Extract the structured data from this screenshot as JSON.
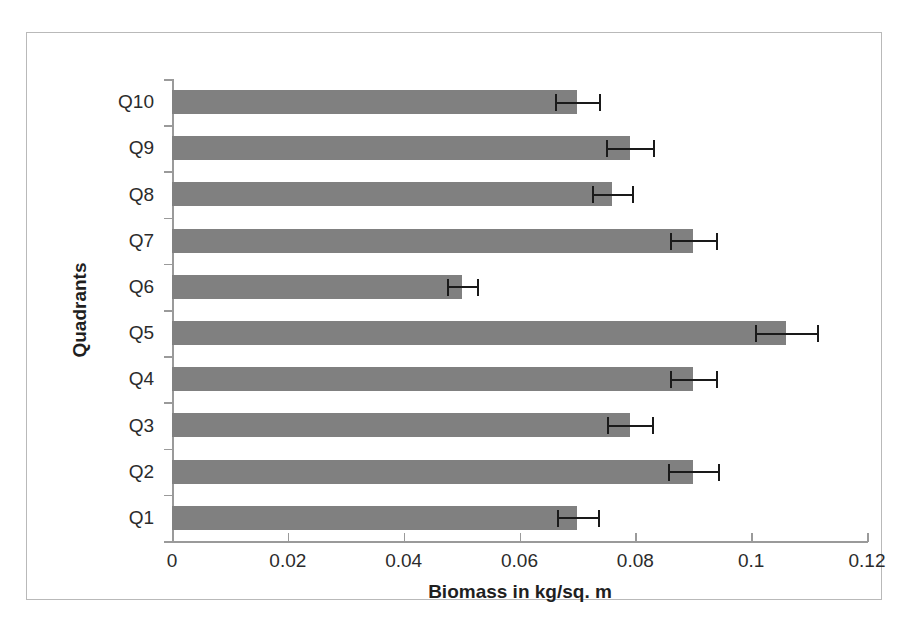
{
  "chart_data": {
    "type": "bar",
    "orientation": "horizontal",
    "title": "",
    "xlabel": "Biomass in kg/sq. m",
    "ylabel": "Quadrants",
    "categories": [
      "Q1",
      "Q2",
      "Q3",
      "Q4",
      "Q5",
      "Q6",
      "Q7",
      "Q8",
      "Q9",
      "Q10"
    ],
    "values": [
      0.07,
      0.09,
      0.079,
      0.09,
      0.106,
      0.05,
      0.09,
      0.076,
      0.079,
      0.07
    ],
    "error_upper": [
      0.0035,
      0.0043,
      0.0039,
      0.004,
      0.0053,
      0.0026,
      0.004,
      0.0035,
      0.004,
      0.0038
    ],
    "error_lower": [
      0.0035,
      0.0043,
      0.0039,
      0.004,
      0.0053,
      0.0026,
      0.004,
      0.0035,
      0.004,
      0.0038
    ],
    "xlim": [
      0,
      0.12
    ],
    "xticks": [
      "0",
      "0.02",
      "0.04",
      "0.06",
      "0.08",
      "0.1",
      "0.12"
    ],
    "xtick_values": [
      0,
      0.02,
      0.04,
      0.06,
      0.08,
      0.1,
      0.12
    ],
    "grid": false,
    "legend": false,
    "bar_color": "#808080",
    "error_color": "#1a1a1a",
    "axis_color": "#9a9a9a",
    "category_order_top_to_bottom": [
      "Q10",
      "Q9",
      "Q8",
      "Q7",
      "Q6",
      "Q5",
      "Q4",
      "Q3",
      "Q2",
      "Q1"
    ]
  }
}
